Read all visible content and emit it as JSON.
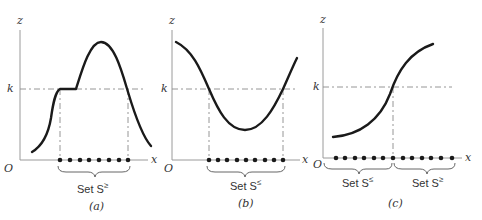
{
  "figure": {
    "panels": [
      {
        "id": "a",
        "caption": "(a)",
        "axis_labels": {
          "y": "z",
          "x": "x",
          "origin": "O",
          "threshold": "k"
        },
        "sets": [
          {
            "label": "Set S",
            "sup": "≥"
          }
        ],
        "description": "Unimodal curve with a flat segment at level k; set where z ≥ k"
      },
      {
        "id": "b",
        "caption": "(b)",
        "axis_labels": {
          "y": "z",
          "x": "x",
          "origin": "O",
          "threshold": "k"
        },
        "sets": [
          {
            "label": "Set S",
            "sup": "≤"
          }
        ],
        "description": "U-shaped curve; set where z ≤ k"
      },
      {
        "id": "c",
        "caption": "(c)",
        "axis_labels": {
          "y": "z",
          "x": "x",
          "origin": "O",
          "threshold": "k"
        },
        "sets": [
          {
            "label": "Set S",
            "sup": "≤"
          },
          {
            "label": "Set S",
            "sup": "≥"
          }
        ],
        "description": "Monotonically increasing S-curve crossing k once; splits domain into S≤ and S≥"
      }
    ],
    "colors": {
      "curve": "#1a1a1a",
      "axis": "#9a9a9a",
      "dashed": "#8a8a8a",
      "text": "#333333"
    }
  }
}
